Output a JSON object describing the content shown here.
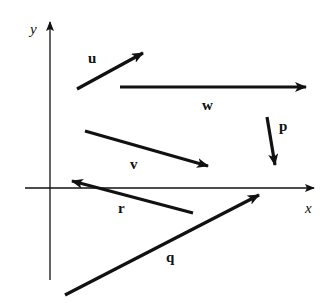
{
  "axes": {
    "x_label": "x",
    "y_label": "y"
  },
  "vectors": [
    {
      "name": "u",
      "label": "u"
    },
    {
      "name": "w",
      "label": "w"
    },
    {
      "name": "p",
      "label": "p"
    },
    {
      "name": "v",
      "label": "v"
    },
    {
      "name": "r",
      "label": "r"
    },
    {
      "name": "q",
      "label": "q"
    }
  ],
  "colors": {
    "ink": "#111111",
    "background": "#ffffff"
  }
}
